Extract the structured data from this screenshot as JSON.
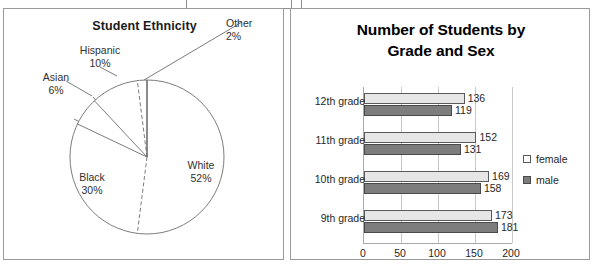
{
  "scan_fragment": {
    "present": true
  },
  "pie_panel": {
    "title": "Student Ethnicity",
    "slices": [
      {
        "label": "White",
        "pct_text": "52%",
        "value": 52
      },
      {
        "label": "Black",
        "pct_text": "30%",
        "value": 30
      },
      {
        "label": "Asian",
        "pct_text": "6%",
        "value": 6
      },
      {
        "label": "Hispanic",
        "pct_text": "10%",
        "value": 10
      },
      {
        "label": "Other",
        "pct_text": "2%",
        "value": 2
      }
    ]
  },
  "bar_panel": {
    "title_line1": "Number of Students by",
    "title_line2": "Grade and Sex",
    "legend": [
      {
        "label": "female",
        "color": "#ffffff"
      },
      {
        "label": "male",
        "color": "#7d7d7d"
      }
    ],
    "axis_ticks": [
      "0",
      "50",
      "100",
      "150",
      "200"
    ],
    "categories": [
      "12th grade",
      "11th grade",
      "10th grade",
      "9th grade"
    ],
    "values": {
      "female": [
        136,
        152,
        169,
        173
      ],
      "male": [
        119,
        131,
        158,
        181
      ]
    },
    "value_labels": {
      "female": [
        "136",
        "152",
        "169",
        "173"
      ],
      "male": [
        "119",
        "131",
        "158",
        "181"
      ]
    }
  },
  "chart_data": [
    {
      "type": "pie",
      "title": "Student Ethnicity",
      "categories": [
        "White",
        "Black",
        "Asian",
        "Hispanic",
        "Other"
      ],
      "values": [
        52,
        30,
        6,
        10,
        2
      ],
      "units": "percent",
      "data_labels": [
        "White 52%",
        "Black 30%",
        "Asian 6%",
        "Hispanic 10%",
        "Other 2%"
      ],
      "legend": "none (labels placed around pie)",
      "start_angle_deg": 0,
      "direction": "clockwise"
    },
    {
      "type": "bar",
      "orientation": "horizontal",
      "title": "Number of Students by Grade and Sex",
      "categories": [
        "12th grade",
        "11th grade",
        "10th grade",
        "9th grade"
      ],
      "series": [
        {
          "name": "female",
          "values": [
            136,
            152,
            169,
            173
          ],
          "color": "#e6e6e6"
        },
        {
          "name": "male",
          "values": [
            119,
            131,
            158,
            181
          ],
          "color": "#7d7d7d"
        }
      ],
      "xlabel": "",
      "ylabel": "",
      "xlim": [
        0,
        200
      ],
      "xticks": [
        0,
        50,
        100,
        150,
        200
      ],
      "grid": "vertical gridlines at ticks",
      "legend_position": "right",
      "data_labels": true
    }
  ]
}
